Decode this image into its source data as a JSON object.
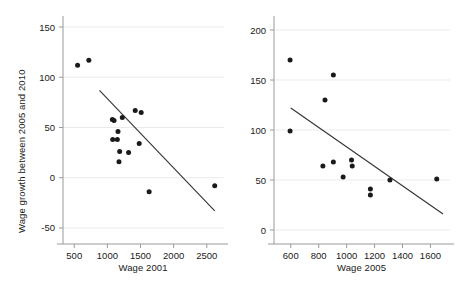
{
  "figure": {
    "background_color": "#ffffff",
    "point_color": "#1a1a1a",
    "line_color": "#333333",
    "axis_color": "#9a9a9a",
    "grid_color": "#ebebeb"
  },
  "chart_data": [
    {
      "type": "scatter",
      "panel": "left",
      "title": "",
      "xlabel": "Wage 2001",
      "ylabel": "Wage growth between 2005 and 2010",
      "xlim": [
        330,
        2760
      ],
      "ylim": [
        -60,
        155
      ],
      "xticks": [
        500,
        1000,
        1500,
        2000,
        2500
      ],
      "yticks": [
        -50,
        0,
        50,
        100,
        150
      ],
      "xticklabels": [
        "500",
        "1000",
        "1500",
        "2000",
        "2500"
      ],
      "yticklabels": [
        "-50",
        "0",
        "50",
        "100",
        "150"
      ],
      "grid": true,
      "legend": "none",
      "points": [
        {
          "x": 550,
          "y": 112
        },
        {
          "x": 720,
          "y": 117
        },
        {
          "x": 1075,
          "y": 58
        },
        {
          "x": 1100,
          "y": 57
        },
        {
          "x": 1080,
          "y": 38
        },
        {
          "x": 1150,
          "y": 38
        },
        {
          "x": 1160,
          "y": 46
        },
        {
          "x": 1225,
          "y": 60
        },
        {
          "x": 1185,
          "y": 26
        },
        {
          "x": 1175,
          "y": 16
        },
        {
          "x": 1320,
          "y": 25
        },
        {
          "x": 1420,
          "y": 67
        },
        {
          "x": 1510,
          "y": 65
        },
        {
          "x": 1480,
          "y": 34
        },
        {
          "x": 1630,
          "y": -14
        },
        {
          "x": 2620,
          "y": -8
        }
      ],
      "trendline": {
        "x1": 880,
        "y1": 87,
        "x2": 2620,
        "y2": -33
      }
    },
    {
      "type": "scatter",
      "panel": "right",
      "title": "",
      "xlabel": "Wage 2005",
      "ylabel": "",
      "xlim": [
        480,
        1740
      ],
      "ylim": [
        -8,
        208
      ],
      "xticks": [
        600,
        800,
        1000,
        1200,
        1400,
        1600
      ],
      "yticks": [
        0,
        50,
        100,
        150,
        200
      ],
      "xticklabels": [
        "600",
        "800",
        "1000",
        "1200",
        "1400",
        "1600"
      ],
      "yticklabels": [
        "0",
        "50",
        "100",
        "150",
        "200"
      ],
      "grid": true,
      "legend": "none",
      "points": [
        {
          "x": 595,
          "y": 170
        },
        {
          "x": 595,
          "y": 99
        },
        {
          "x": 845,
          "y": 130
        },
        {
          "x": 905,
          "y": 155
        },
        {
          "x": 830,
          "y": 64
        },
        {
          "x": 905,
          "y": 68
        },
        {
          "x": 975,
          "y": 53
        },
        {
          "x": 1035,
          "y": 70
        },
        {
          "x": 1040,
          "y": 64
        },
        {
          "x": 1170,
          "y": 41
        },
        {
          "x": 1170,
          "y": 35
        },
        {
          "x": 1310,
          "y": 50
        },
        {
          "x": 1645,
          "y": 51
        }
      ],
      "trendline": {
        "x1": 600,
        "y1": 122,
        "x2": 1690,
        "y2": 16
      }
    }
  ]
}
